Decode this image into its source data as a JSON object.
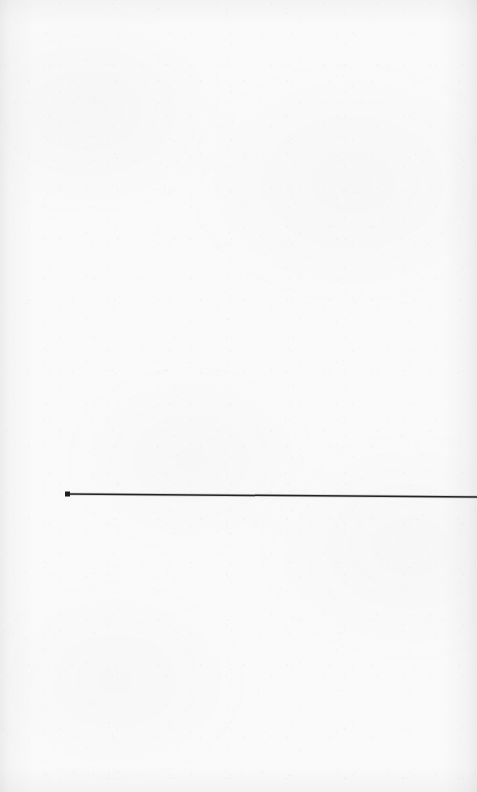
{
  "document": {
    "kind": "scanned-blank-sheet",
    "width": 477,
    "height": 792,
    "page_text": "",
    "paper_color": "#fafafa",
    "vignette_color": "#787878"
  },
  "artwork": {
    "caption": "",
    "ink_color": "#232323",
    "elements": [
      {
        "name": "horizontal-rule",
        "type": "line",
        "x1": 67,
        "y1": 494,
        "x2": 477,
        "y2": 497,
        "stroke": "#232323",
        "stroke_width": 1.5,
        "clipped_at_right_edge": true
      },
      {
        "name": "left-endpoint-marker",
        "type": "square-dot",
        "cx": 67.5,
        "cy": 494,
        "size": 5,
        "fill": "#1d1d1d"
      }
    ]
  }
}
